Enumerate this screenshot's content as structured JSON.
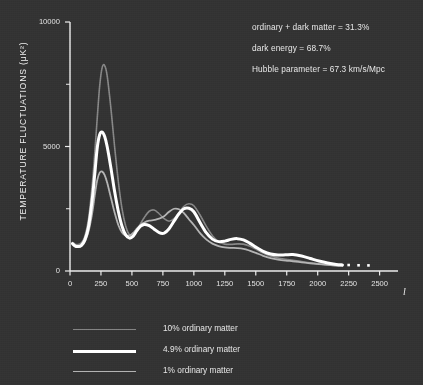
{
  "colors": {
    "background": "#333333",
    "axis": "#ededed",
    "text": "#e8e8e8",
    "curve_10pct": "#878787",
    "curve_49pct": "#ffffff",
    "curve_1pct": "#b4b4b4"
  },
  "annotations": [
    "ordinary + dark matter = 31.3%",
    "dark energy = 68.7%",
    "Hubble parameter = 67.3 km/s/Mpc"
  ],
  "legend": {
    "items": [
      {
        "label": "10% ordinary matter",
        "color": "#878787",
        "width": 1.6
      },
      {
        "label": "4.9% ordinary matter",
        "color": "#ffffff",
        "width": 3.0
      },
      {
        "label": "1% ordinary matter",
        "color": "#b4b4b4",
        "width": 1.8
      }
    ]
  },
  "chart_data": {
    "type": "line",
    "title": "",
    "xlabel": "l",
    "ylabel": "TEMPERATURE FLUCTUATIONS (μK²)",
    "xlim": [
      0,
      2600
    ],
    "ylim": [
      0,
      10000
    ],
    "xticks": [
      0,
      250,
      500,
      750,
      1000,
      1250,
      1500,
      1750,
      2000,
      2250,
      2500
    ],
    "yticks": [
      0,
      5000,
      10000
    ],
    "yticks_minor": [
      2500,
      7500
    ],
    "grid": false,
    "legend_position": "below-left",
    "series": [
      {
        "name": "10% ordinary matter",
        "color": "#878787",
        "width": 1.6,
        "x": [
          20,
          40,
          60,
          90,
          120,
          150,
          180,
          200,
          220,
          240,
          260,
          280,
          300,
          330,
          360,
          390,
          420,
          450,
          480,
          510,
          540,
          570,
          600,
          640,
          680,
          720,
          760,
          800,
          840,
          880,
          920,
          960,
          1000,
          1050,
          1100,
          1150,
          1200,
          1250,
          1300,
          1350,
          1400,
          1450,
          1500,
          1560,
          1620,
          1680,
          1740,
          1800,
          1870,
          1940,
          2010,
          2080,
          2150,
          2200
        ],
        "y": [
          1150,
          1080,
          1060,
          1120,
          1400,
          2100,
          3500,
          4750,
          6150,
          7450,
          8180,
          8250,
          7850,
          6550,
          5000,
          3600,
          2500,
          1800,
          1450,
          1400,
          1600,
          1900,
          2150,
          2400,
          2450,
          2300,
          2100,
          2000,
          2100,
          2350,
          2600,
          2700,
          2620,
          2250,
          1800,
          1420,
          1180,
          1080,
          1070,
          1090,
          1080,
          1000,
          880,
          720,
          600,
          520,
          470,
          430,
          380,
          330,
          290,
          250,
          220,
          205
        ]
      },
      {
        "name": "4.9% ordinary matter",
        "color": "#ffffff",
        "width": 3.0,
        "x": [
          20,
          40,
          60,
          90,
          120,
          150,
          180,
          200,
          220,
          240,
          260,
          280,
          300,
          330,
          360,
          390,
          420,
          450,
          480,
          510,
          540,
          570,
          600,
          640,
          680,
          720,
          760,
          800,
          840,
          880,
          920,
          960,
          1000,
          1050,
          1100,
          1150,
          1200,
          1250,
          1300,
          1350,
          1400,
          1450,
          1500,
          1560,
          1620,
          1680,
          1740,
          1800,
          1870,
          1940,
          2010,
          2080,
          2150,
          2200
        ],
        "y": [
          1100,
          1010,
          980,
          1020,
          1250,
          1800,
          2900,
          3900,
          4950,
          5480,
          5580,
          5400,
          5000,
          4150,
          3200,
          2400,
          1800,
          1450,
          1320,
          1400,
          1620,
          1800,
          1870,
          1820,
          1680,
          1540,
          1520,
          1700,
          2000,
          2300,
          2500,
          2520,
          2380,
          1950,
          1540,
          1280,
          1180,
          1200,
          1270,
          1300,
          1250,
          1120,
          960,
          790,
          680,
          640,
          650,
          660,
          600,
          500,
          400,
          320,
          265,
          245
        ]
      },
      {
        "name": "1% ordinary matter",
        "color": "#b4b4b4",
        "width": 1.8,
        "x": [
          20,
          40,
          60,
          90,
          120,
          150,
          180,
          200,
          220,
          240,
          260,
          280,
          300,
          330,
          360,
          390,
          420,
          450,
          480,
          510,
          540,
          570,
          600,
          640,
          680,
          720,
          760,
          800,
          840,
          880,
          920,
          960,
          1000,
          1050,
          1100,
          1150,
          1200,
          1250,
          1300,
          1350,
          1400,
          1450,
          1500,
          1560,
          1620,
          1680,
          1740,
          1800,
          1870,
          1940,
          2010,
          2080,
          2150,
          2200
        ],
        "y": [
          1080,
          1000,
          960,
          990,
          1180,
          1600,
          2350,
          3050,
          3650,
          3950,
          3990,
          3850,
          3550,
          2950,
          2350,
          1850,
          1550,
          1420,
          1420,
          1530,
          1700,
          1850,
          1950,
          2020,
          2050,
          2100,
          2200,
          2380,
          2500,
          2480,
          2320,
          2080,
          1850,
          1520,
          1270,
          1100,
          1000,
          950,
          930,
          920,
          890,
          820,
          730,
          610,
          520,
          460,
          420,
          390,
          350,
          310,
          275,
          245,
          220,
          210
        ]
      }
    ],
    "markers": {
      "name": "end-dots",
      "color": "#ffffff",
      "x": [
        2250,
        2330,
        2410
      ],
      "y": [
        240,
        230,
        225
      ]
    }
  }
}
